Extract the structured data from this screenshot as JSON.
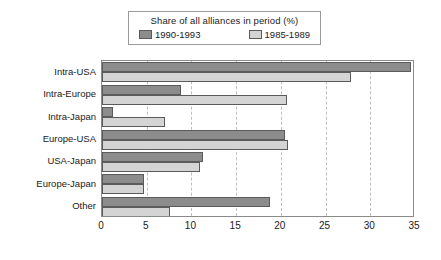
{
  "chart_data": {
    "type": "bar",
    "orientation": "horizontal",
    "title": "",
    "legend_title": "Share of all alliances in period (%)",
    "legend_position": "top-center",
    "xlabel": "",
    "ylabel": "",
    "xlim": [
      0,
      35
    ],
    "xticks": [
      0,
      5,
      10,
      15,
      20,
      25,
      30,
      35
    ],
    "grid": "vertical-dashed",
    "categories": [
      "Intra-USA",
      "Intra-Europe",
      "Intra-Japan",
      "Europe-USA",
      "USA-Japan",
      "Europe-Japan",
      "Other"
    ],
    "series": [
      {
        "name": "1990-1993",
        "color": "#8c8c8c",
        "values": [
          34.5,
          8.8,
          1.2,
          20.5,
          11.3,
          4.7,
          18.8
        ]
      },
      {
        "name": "1985-1989",
        "color": "#d4d4d4",
        "values": [
          27.8,
          20.7,
          7.0,
          20.8,
          11.0,
          4.7,
          7.6
        ]
      }
    ]
  },
  "legend": {
    "title": "Share of all alliances in period (%)",
    "entries": [
      {
        "label": "1990-1993",
        "swatch": "series-a"
      },
      {
        "label": "1985-1989",
        "swatch": "series-b"
      }
    ]
  },
  "axis": {
    "x_tick_labels": [
      "0",
      "5",
      "10",
      "15",
      "20",
      "25",
      "30",
      "35"
    ]
  },
  "colors": {
    "series_a": "#8c8c8c",
    "series_b": "#d4d4d4",
    "bar_outline": "#5b5b5b",
    "frame": "#8a8a8a",
    "gridline": "#bdbdbd",
    "background": "#ffffff",
    "text": "#1a1a1a"
  }
}
